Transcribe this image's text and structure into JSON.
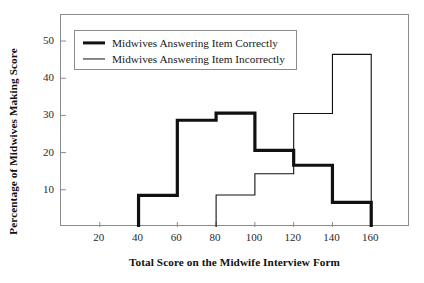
{
  "chart_data": {
    "type": "line",
    "title": "",
    "xlabel": "Total Score on the Midwife Interview Form",
    "ylabel": "Percentage of Midwives Making Score",
    "xlim": [
      0,
      180
    ],
    "ylim": [
      0,
      57
    ],
    "grid": false,
    "legend_position": "upper-left-inside",
    "xticks": [
      20,
      40,
      60,
      80,
      100,
      120,
      140,
      160
    ],
    "yticks": [
      10,
      20,
      30,
      40,
      50
    ],
    "bin_width": 20,
    "series": [
      {
        "name": "Midwives Answering Item Correctly",
        "style": "thick-step",
        "color": "#111111",
        "line_width": 3.2,
        "bin_starts": [
          40,
          60,
          80,
          100,
          120,
          140
        ],
        "bin_ends": [
          60,
          80,
          100,
          120,
          140,
          160
        ],
        "values": [
          8.5,
          28.7,
          30.6,
          20.6,
          16.6,
          6.6
        ]
      },
      {
        "name": "Midwives Answering Item Incorrectly",
        "style": "thin-step",
        "color": "#111111",
        "line_width": 1.1,
        "bin_starts": [
          80,
          100,
          120,
          140
        ],
        "bin_ends": [
          100,
          120,
          140,
          160
        ],
        "values": [
          8.6,
          14.3,
          30.5,
          46.4
        ]
      }
    ]
  },
  "axes": {
    "y_tick_labels": [
      "10",
      "20",
      "30",
      "40",
      "50"
    ],
    "x_tick_labels": [
      "20",
      "40",
      "60",
      "80",
      "100",
      "120",
      "140",
      "160"
    ],
    "y_axis_title": "Percentage of Midwives Making Score",
    "x_axis_title": "Total Score on the Midwife Interview Form"
  },
  "legend": {
    "items": [
      {
        "label": "Midwives Answering Item Correctly",
        "swatch": "thick-line-swatch"
      },
      {
        "label": "Midwives Answering Item Incorrectly",
        "swatch": "thin-line-swatch"
      }
    ]
  }
}
